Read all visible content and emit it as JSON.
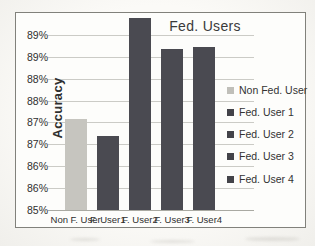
{
  "chart_data": {
    "type": "bar",
    "title": "Fed. Users",
    "xlabel": "",
    "ylabel": "Accuracy",
    "categories": [
      "Non F. User",
      "F. User1",
      "F. User2",
      "F. User3",
      "F. User4"
    ],
    "values": [
      87.1,
      86.7,
      89.4,
      88.7,
      88.75
    ],
    "bar_colors": [
      "#c6c5bf",
      "#4a4a51",
      "#4a4a51",
      "#4a4a51",
      "#4a4a51"
    ],
    "ylim": [
      85,
      89.5
    ],
    "yticks": [
      {
        "value": 89.0,
        "label": "89%"
      },
      {
        "value": 88.5,
        "label": "89%"
      },
      {
        "value": 88.0,
        "label": "88%"
      },
      {
        "value": 87.5,
        "label": "88%"
      },
      {
        "value": 87.0,
        "label": "87%"
      },
      {
        "value": 86.5,
        "label": "87%"
      },
      {
        "value": 86.0,
        "label": "86%"
      },
      {
        "value": 85.5,
        "label": "86%"
      },
      {
        "value": 85.0,
        "label": "85%"
      }
    ],
    "grid": true,
    "legend": {
      "position": "right",
      "entries": [
        {
          "label": "Non Fed. User",
          "color": "#c0bfb9"
        },
        {
          "label": "Fed. User 1",
          "color": "#434349"
        },
        {
          "label": "Fed. User 2",
          "color": "#434349"
        },
        {
          "label": "Fed. User 3",
          "color": "#434349"
        },
        {
          "label": "Fed. User 4",
          "color": "#434349"
        }
      ]
    },
    "colors": {
      "page_bg": "#f6f5f1",
      "chart_bg": "#fdfdfb",
      "border": "#81817b",
      "gridline": "#cbcbc6",
      "axis_line": "#a9a9a2",
      "text": "#3a3a3a"
    }
  }
}
